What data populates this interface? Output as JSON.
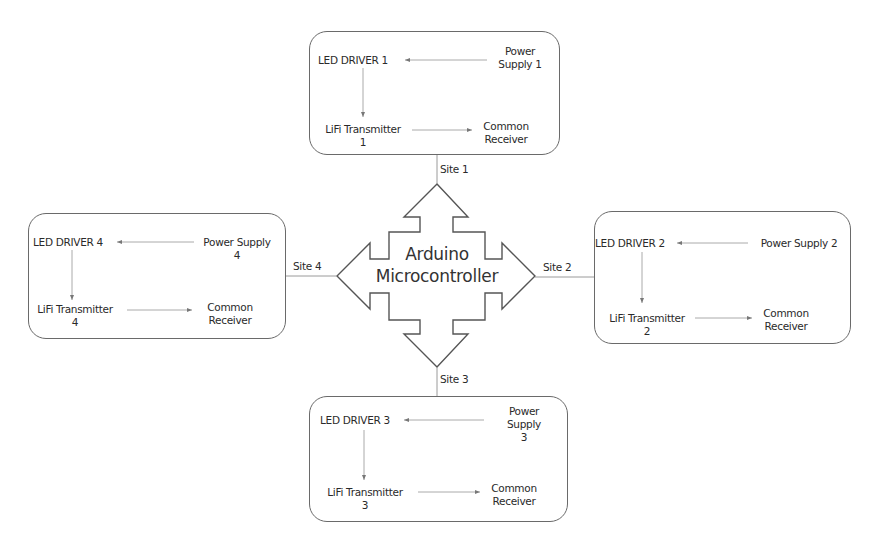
{
  "diagram": {
    "title": "Arduino Microcontroller",
    "center": {
      "line1": "Arduino",
      "line2": "Microcontroller"
    },
    "sites": [
      {
        "id": 1,
        "site_label": "Site 1",
        "led_driver": "LED DRIVER 1",
        "power_supply": {
          "line1": "Power",
          "line2": "Supply 1",
          "line3": ""
        },
        "transmitter": {
          "line1": "LiFi Transmitter",
          "line2": "1"
        },
        "receiver": {
          "line1": "Common",
          "line2": "Receiver"
        }
      },
      {
        "id": 2,
        "site_label": "Site 2",
        "led_driver": "LED DRIVER 2",
        "power_supply": {
          "line1": "Power Supply 2",
          "line2": "",
          "line3": ""
        },
        "transmitter": {
          "line1": "LiFi Transmitter",
          "line2": "2"
        },
        "receiver": {
          "line1": "Common",
          "line2": "Receiver"
        }
      },
      {
        "id": 3,
        "site_label": "Site 3",
        "led_driver": "LED DRIVER 3",
        "power_supply": {
          "line1": "Power",
          "line2": "Supply",
          "line3": "3"
        },
        "transmitter": {
          "line1": "LiFi Transmitter",
          "line2": "3"
        },
        "receiver": {
          "line1": "Common",
          "line2": "Receiver"
        }
      },
      {
        "id": 4,
        "site_label": "Site 4",
        "led_driver": "LED DRIVER 4",
        "power_supply": {
          "line1": "Power Supply",
          "line2": "4",
          "line3": ""
        },
        "transmitter": {
          "line1": "LiFi Transmitter",
          "line2": "4"
        },
        "receiver": {
          "line1": "Common",
          "line2": "Receiver"
        }
      }
    ],
    "colors": {
      "outline": "#6a6a6a",
      "connector": "#9a9a9a",
      "text": "#2a2a2a",
      "background": "#ffffff"
    }
  }
}
